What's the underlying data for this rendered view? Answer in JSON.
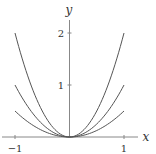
{
  "chart_data": {
    "type": "line",
    "title": "",
    "xlabel": "x",
    "ylabel": "y",
    "xlim": [
      -1.1,
      1.2
    ],
    "ylim": [
      -0.05,
      2.25
    ],
    "xticks": [
      -1,
      1
    ],
    "xtick_labels": [
      "−1",
      "1"
    ],
    "yticks": [
      1,
      2
    ],
    "ytick_labels": [
      "1",
      "2"
    ],
    "grid": false,
    "legend": null,
    "series": [
      {
        "name": "y = 2x²",
        "coef": 2,
        "x": [
          -1,
          -0.5,
          0,
          0.5,
          1
        ],
        "values": [
          2,
          0.5,
          0,
          0.5,
          2
        ]
      },
      {
        "name": "y = x²",
        "coef": 1,
        "x": [
          -1,
          -0.5,
          0,
          0.5,
          1
        ],
        "values": [
          1,
          0.25,
          0,
          0.25,
          1
        ]
      },
      {
        "name": "y = 0.5x²",
        "coef": 0.5,
        "x": [
          -1,
          -0.5,
          0,
          0.5,
          1
        ],
        "values": [
          0.5,
          0.125,
          0,
          0.125,
          0.5
        ]
      }
    ],
    "colors": {
      "curve": "#555555",
      "axis": "#888888"
    }
  }
}
